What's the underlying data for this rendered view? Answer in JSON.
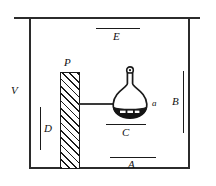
{
  "figure": {
    "type": "physics-apparatus-diagram",
    "colors": {
      "stroke": "#1a1a1a",
      "wall": "#2b2b2b",
      "rod": "#3a3a3a",
      "flask_contents": "#111111",
      "background": "#ffffff"
    },
    "labels": {
      "vessel": "V",
      "plate": "P",
      "top_marker": "E",
      "right_marker": "B",
      "left_marker": "D",
      "flask_base_marker": "C",
      "bottom_marker": "A",
      "flask_pointer": "a"
    },
    "parts": [
      {
        "name": "outer-vessel",
        "label": "V",
        "shape": "rectangle"
      },
      {
        "name": "hatched-plate",
        "label": "P",
        "shape": "hatched-rectangle"
      },
      {
        "name": "connecting-rod",
        "label": "",
        "shape": "horizontal-line"
      },
      {
        "name": "round-bottom-flask",
        "label": "a",
        "shape": "flask-with-contents"
      },
      {
        "name": "marker-line-top",
        "label": "E",
        "shape": "horizontal-line"
      },
      {
        "name": "marker-line-right",
        "label": "B",
        "shape": "vertical-line"
      },
      {
        "name": "marker-line-left",
        "label": "D",
        "shape": "vertical-line"
      },
      {
        "name": "marker-line-flask-base",
        "label": "C",
        "shape": "horizontal-line"
      },
      {
        "name": "marker-line-bottom",
        "label": "A",
        "shape": "horizontal-line"
      }
    ]
  }
}
